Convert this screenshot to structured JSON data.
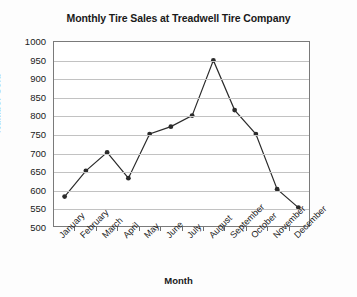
{
  "chart_data": {
    "type": "line",
    "title": "Monthly Tire Sales at Treadwell Tire Company",
    "xlabel": "Month",
    "ylabel": "Number Sold",
    "categories": [
      "January",
      "February",
      "March",
      "April",
      "May",
      "June",
      "July",
      "August",
      "September",
      "October",
      "November",
      "December"
    ],
    "values": [
      580,
      650,
      700,
      630,
      750,
      770,
      800,
      950,
      815,
      750,
      600,
      550
    ],
    "ylim": [
      500,
      1000
    ],
    "ytick_step": 50,
    "yticks": [
      1000,
      950,
      900,
      850,
      800,
      750,
      700,
      650,
      600,
      550,
      500
    ],
    "grid": true,
    "legend": false,
    "series_color": "#2b2b2b",
    "marker": "circle",
    "gridline_color": "#c2c2c2",
    "frame_color": "#7a7a7a",
    "background_color": "#fdfdfd"
  }
}
